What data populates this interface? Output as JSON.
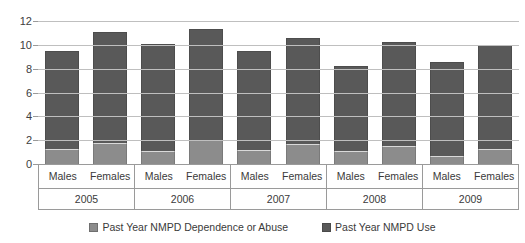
{
  "chart_data": {
    "type": "bar",
    "subtype": "stacked-bar",
    "title": "",
    "xlabel": "",
    "ylabel": "",
    "ylim": [
      0,
      12
    ],
    "y_ticks": [
      0,
      2,
      4,
      6,
      8,
      10,
      12
    ],
    "y_tick_labels": [
      "0",
      "2",
      "4",
      "6",
      "8",
      "10",
      "12"
    ],
    "grid": true,
    "legend_position": "bottom",
    "group_labels": [
      "2005",
      "2006",
      "2007",
      "2008",
      "2009"
    ],
    "categories": [
      "2005 Males",
      "2005 Females",
      "2006 Males",
      "2006 Females",
      "2007 Males",
      "2007 Females",
      "2008 Males",
      "2008 Females",
      "2009 Males",
      "2009 Females"
    ],
    "subgroup_labels": [
      "Males",
      "Females"
    ],
    "series": [
      {
        "name": "Past Year NMPD Dependence or Abuse",
        "color": "#8c8c8c",
        "values": [
          1.3,
          1.8,
          1.1,
          2.0,
          1.2,
          1.7,
          1.1,
          1.5,
          0.7,
          1.3
        ]
      },
      {
        "name": "Past Year NMPD Use",
        "color": "#595959",
        "values": [
          8.2,
          9.3,
          9.0,
          9.3,
          8.3,
          8.9,
          7.1,
          8.7,
          7.9,
          8.7
        ]
      }
    ],
    "totals": [
      9.5,
      11.1,
      10.1,
      11.3,
      9.5,
      10.6,
      8.2,
      10.2,
      8.6,
      10.0
    ],
    "groups": [
      {
        "year": "2005",
        "bars": [
          {
            "label": "Males",
            "dependence_or_abuse": 1.3,
            "use": 8.2,
            "total": 9.5
          },
          {
            "label": "Females",
            "dependence_or_abuse": 1.8,
            "use": 9.3,
            "total": 11.1
          }
        ]
      },
      {
        "year": "2006",
        "bars": [
          {
            "label": "Males",
            "dependence_or_abuse": 1.1,
            "use": 9.0,
            "total": 10.1
          },
          {
            "label": "Females",
            "dependence_or_abuse": 2.0,
            "use": 9.3,
            "total": 11.3
          }
        ]
      },
      {
        "year": "2007",
        "bars": [
          {
            "label": "Males",
            "dependence_or_abuse": 1.2,
            "use": 8.3,
            "total": 9.5
          },
          {
            "label": "Females",
            "dependence_or_abuse": 1.7,
            "use": 8.9,
            "total": 10.6
          }
        ]
      },
      {
        "year": "2008",
        "bars": [
          {
            "label": "Males",
            "dependence_or_abuse": 1.1,
            "use": 7.1,
            "total": 8.2
          },
          {
            "label": "Females",
            "dependence_or_abuse": 1.5,
            "use": 8.7,
            "total": 10.2
          }
        ]
      },
      {
        "year": "2009",
        "bars": [
          {
            "label": "Males",
            "dependence_or_abuse": 0.7,
            "use": 7.9,
            "total": 8.6
          },
          {
            "label": "Females",
            "dependence_or_abuse": 1.3,
            "use": 8.7,
            "total": 10.0
          }
        ]
      }
    ]
  },
  "legend": {
    "items": [
      {
        "label": "Past Year NMPD Dependence or Abuse",
        "swatch": "dep"
      },
      {
        "label": "Past Year NMPD Use",
        "swatch": "use"
      }
    ]
  },
  "colors": {
    "series_dependence": "#8c8c8c",
    "series_use": "#595959",
    "gridline": "#bfbfbf",
    "axis": "#9a9a9a",
    "text": "#3a3a3a",
    "background": "#ffffff"
  }
}
